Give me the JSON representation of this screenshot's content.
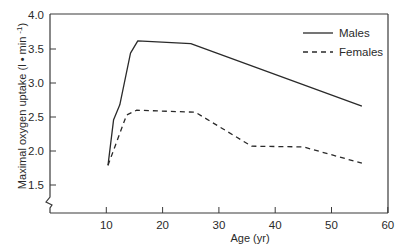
{
  "chart_data": {
    "type": "line",
    "title": "",
    "xlabel": "Age (yr)",
    "ylabel": "Maximal oxygen uptake (l • min -1)",
    "ylabel_parts": {
      "main": "Maximal oxygen uptake (l • min ",
      "sup": "-1",
      "end": ")"
    },
    "xlim": [
      0,
      60
    ],
    "ylim": [
      1.1,
      4.0
    ],
    "x_ticks": [
      10,
      20,
      30,
      40,
      50,
      60
    ],
    "x_tick_labels": [
      "10",
      "20",
      "30",
      "40",
      "50",
      "60"
    ],
    "y_ticks": [
      1.5,
      2.0,
      2.5,
      3.0,
      3.5,
      4.0
    ],
    "y_tick_labels": [
      "1.5",
      "2.0",
      "2.5",
      "3.0",
      "3.5",
      "4.0"
    ],
    "y_axis_break": true,
    "grid": false,
    "legend_position": "top-right",
    "series": [
      {
        "name": "Males",
        "style": "solid",
        "x": [
          10.3,
          11.3,
          12.4,
          14.3,
          15.6,
          25,
          55.4
        ],
        "values": [
          1.79,
          2.46,
          2.68,
          3.44,
          3.62,
          3.58,
          2.66
        ]
      },
      {
        "name": "Females",
        "style": "dashed",
        "x": [
          10.3,
          13.6,
          15.4,
          25.8,
          35.8,
          45,
          55.4
        ],
        "values": [
          1.79,
          2.53,
          2.6,
          2.57,
          2.07,
          2.06,
          1.82
        ]
      }
    ],
    "colors": {
      "line": "#2a2a2a",
      "axis": "#3a3a3a",
      "background": "#ffffff"
    }
  },
  "legend": {
    "items": [
      {
        "label": "Males",
        "style": "solid"
      },
      {
        "label": "Females",
        "style": "dashed"
      }
    ]
  }
}
